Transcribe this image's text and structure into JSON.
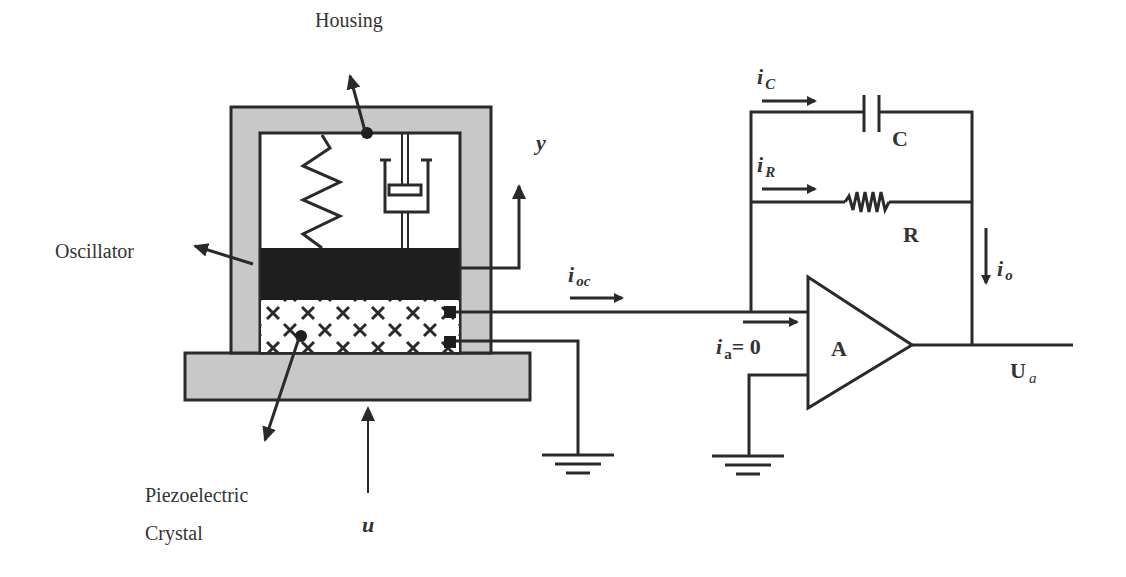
{
  "diagram": {
    "type": "piezoelectric accelerometer with charge amplifier",
    "colors": {
      "line": "#2a2a2a",
      "housing_fill": "#c8c8c8",
      "oscillator_fill": "#1e1e1e",
      "background": "#ffffff"
    },
    "labels": {
      "housing": "Housing",
      "oscillator": "Oscillator",
      "piezo_line1": "Piezoelectric",
      "piezo_line2": "Crystal",
      "y": "y",
      "u": "u",
      "i_oc_main": "i",
      "i_oc_sub": "oc",
      "i_c_main": "i",
      "i_c_sub": "C",
      "capacitor": "C",
      "i_r_main": "i",
      "i_r_sub": "R",
      "resistor": "R",
      "i_o_main": "i",
      "i_o_sub": "o",
      "i_a_main": "i",
      "i_a_sub": "a",
      "i_a_eq": "= 0",
      "amplifier": "A",
      "u_a_main": "U",
      "u_a_sub": "a"
    }
  }
}
